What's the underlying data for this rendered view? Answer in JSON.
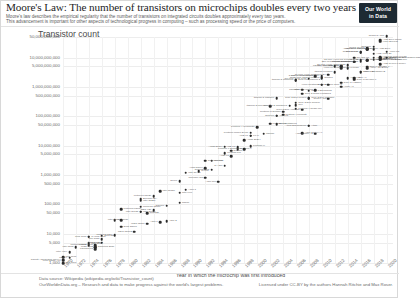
{
  "header": {
    "title": "Moore's Law: The number of transistors on microchips doubles every two years",
    "subtitle_line1": "Moore's law describes the empirical regularity that the number of transistors on integrated circuits doubles approximately every two years.",
    "subtitle_line2": "This advancement is important for other aspects of technological progress in computing – such as processing speed or the price of computers.",
    "logo_line1": "Our World",
    "logo_line2": "in Data"
  },
  "footer": {
    "source": "Data source: Wikipedia (wikipedia.org/wiki/Transistor_count)",
    "org": "OurWorldinData.org – Research and data to make progress against the world's largest problems.",
    "license": "Licensed under CC-BY by the authors Hannah Ritchie and Max Roser."
  },
  "chart_data": {
    "type": "scatter",
    "title": "Moore's Law: The number of transistors on microchips doubles every two years",
    "ylabel": "Transistor count",
    "xlabel": "Year in which the microchip was first introduced",
    "yscale": "log",
    "ylim": [
      1000,
      50000000000
    ],
    "xlim": [
      1970,
      2021
    ],
    "grid": true,
    "legend": "none",
    "ytick_labels": [
      "50,000,000,000",
      "10,000,000,000",
      "5,000,000,000",
      "1,000,000,000",
      "500,000,000",
      "100,000,000",
      "50,000,000",
      "10,000,000",
      "5,000,000",
      "1,000,000",
      "500,000",
      "100,000",
      "50,000",
      "10,000",
      "5,000",
      "1,000"
    ],
    "ytick_values": [
      50000000000,
      10000000000,
      5000000000,
      1000000000,
      500000000,
      100000000,
      50000000,
      10000000,
      5000000,
      1000000,
      500000,
      100000,
      50000,
      10000,
      5000,
      1000
    ],
    "xtick_labels": [
      "1970",
      "1972",
      "1974",
      "1976",
      "1978",
      "1980",
      "1982",
      "1984",
      "1986",
      "1988",
      "1990",
      "1992",
      "1994",
      "1996",
      "1998",
      "2000",
      "2002",
      "2004",
      "2006",
      "2008",
      "2010",
      "2012",
      "2014",
      "2016",
      "2018",
      "2020"
    ],
    "points": [
      {
        "name": "Intel 4004",
        "year": 1971,
        "value": 2300,
        "side": "left"
      },
      {
        "name": "Intel 8008",
        "year": 1972,
        "value": 3500,
        "side": "left"
      },
      {
        "name": "Motorola 6800",
        "year": 1974,
        "value": 4100,
        "side": "left"
      },
      {
        "name": "Intel 8080",
        "year": 1974,
        "value": 4500,
        "side": "right"
      },
      {
        "name": "RCA 1802",
        "year": 1974,
        "value": 5000,
        "side": "right"
      },
      {
        "name": "MOS 6502",
        "year": 1975,
        "value": 3510,
        "side": "left"
      },
      {
        "name": "Zilog Z80",
        "year": 1976,
        "value": 8500,
        "side": "right"
      },
      {
        "name": "Intel 8085",
        "year": 1976,
        "value": 6500,
        "side": "left"
      },
      {
        "name": "TMS 1000",
        "year": 1974,
        "value": 8000,
        "side": "left"
      },
      {
        "name": "Motorola 6809",
        "year": 1978,
        "value": 9000,
        "side": "left"
      },
      {
        "name": "Intel 8086",
        "year": 1978,
        "value": 29000,
        "side": "right"
      },
      {
        "name": "Intel 8088",
        "year": 1979,
        "value": 29000,
        "side": "left"
      },
      {
        "name": "Zilog Z8000",
        "year": 1979,
        "value": 17500,
        "side": "right"
      },
      {
        "name": "WDC 65C02",
        "year": 1981,
        "value": 11500,
        "side": "left"
      },
      {
        "name": "Intel 80186",
        "year": 1982,
        "value": 55000,
        "side": "right"
      },
      {
        "name": "Motorola 68000",
        "year": 1979,
        "value": 68000,
        "side": "right"
      },
      {
        "name": "Intel 80286",
        "year": 1982,
        "value": 134000,
        "side": "right"
      },
      {
        "name": "Intel 80386",
        "year": 1985,
        "value": 275000,
        "side": "right"
      },
      {
        "name": "ARM 1",
        "year": 1985,
        "value": 25000,
        "side": "left"
      },
      {
        "name": "ARM 2",
        "year": 1986,
        "value": 27000,
        "side": "right"
      },
      {
        "name": "Motorola 68020",
        "year": 1984,
        "value": 190000,
        "side": "left"
      },
      {
        "name": "Intel i960",
        "year": 1988,
        "value": 250000,
        "side": "right"
      },
      {
        "name": "ARM 3",
        "year": 1989,
        "value": 310000,
        "side": "right"
      },
      {
        "name": "Intel 80486",
        "year": 1989,
        "value": 1180000,
        "side": "right"
      },
      {
        "name": "R4000",
        "year": 1991,
        "value": 1350000,
        "side": "right"
      },
      {
        "name": "Pentium",
        "year": 1993,
        "value": 3100000,
        "side": "right"
      },
      {
        "name": "ARM 700",
        "year": 1994,
        "value": 578977,
        "side": "left"
      },
      {
        "name": "Pentium Pro",
        "year": 1995,
        "value": 5500000,
        "side": "right"
      },
      {
        "name": "AMD K5",
        "year": 1996,
        "value": 4300000,
        "side": "left"
      },
      {
        "name": "Pentium II",
        "year": 1997,
        "value": 7500000,
        "side": "right"
      },
      {
        "name": "AMD K6",
        "year": 1997,
        "value": 8800000,
        "side": "left"
      },
      {
        "name": "Pentium III",
        "year": 1999,
        "value": 9500000,
        "side": "right"
      },
      {
        "name": "AMD K7",
        "year": 1999,
        "value": 22000000,
        "side": "left"
      },
      {
        "name": "Pentium 4 Willamette",
        "year": 2000,
        "value": 42000000,
        "side": "left"
      },
      {
        "name": "Pentium 4 Northwood",
        "year": 2002,
        "value": 55000000,
        "side": "right"
      },
      {
        "name": "Barton",
        "year": 2003,
        "value": 54300000,
        "side": "right"
      },
      {
        "name": "Pentium 4 Prescott",
        "year": 2004,
        "value": 112000000,
        "side": "right"
      },
      {
        "name": "Itanium",
        "year": 2001,
        "value": 25000000,
        "side": "right"
      },
      {
        "name": "Itanium 2 McKinley",
        "year": 2002,
        "value": 220000000,
        "side": "left"
      },
      {
        "name": "Itanium 2 Madison",
        "year": 2003,
        "value": 410000000,
        "side": "left"
      },
      {
        "name": "Cell",
        "year": 2006,
        "value": 241000000,
        "side": "right"
      },
      {
        "name": "Core 2 Duo Conroe",
        "year": 2006,
        "value": 291000000,
        "side": "right"
      },
      {
        "name": "Core 2 Duo Wolfdale",
        "year": 2008,
        "value": 411000000,
        "side": "right"
      },
      {
        "name": "Atom",
        "year": 2008,
        "value": 47000000,
        "side": "right"
      },
      {
        "name": "Core i7 Bloomfield",
        "year": 2008,
        "value": 731000000,
        "side": "right"
      },
      {
        "name": "Itanium 2 Montecito",
        "year": 2006,
        "value": 1700000000,
        "side": "left"
      },
      {
        "name": "Six-core Xeon 7400",
        "year": 2008,
        "value": 1900000000,
        "side": "left"
      },
      {
        "name": "Quad-core Itanium Tukwila",
        "year": 2010,
        "value": 2000000000,
        "side": "left"
      },
      {
        "name": "8-core Xeon Nehalem-EX",
        "year": 2010,
        "value": 2300000000,
        "side": "left"
      },
      {
        "name": "10-core Xeon Westmere-EX",
        "year": 2011,
        "value": 2600000000,
        "side": "left"
      },
      {
        "name": "Six-core Core i7",
        "year": 2010,
        "value": 1170000000,
        "side": "right"
      },
      {
        "name": "Dual-core Itanium 2",
        "year": 2006,
        "value": 1700000000,
        "side": "right"
      },
      {
        "name": "Apple A7",
        "year": 2013,
        "value": 1000000000,
        "side": "right"
      },
      {
        "name": "Apple A8",
        "year": 2014,
        "value": 2000000000,
        "side": "right"
      },
      {
        "name": "Apple A9",
        "year": 2015,
        "value": 2000000000,
        "side": "right"
      },
      {
        "name": "Apple A10",
        "year": 2016,
        "value": 3300000000,
        "side": "right"
      },
      {
        "name": "Apple A11 Bionic",
        "year": 2017,
        "value": 4300000000,
        "side": "right"
      },
      {
        "name": "Apple A12X Bionic",
        "year": 2018,
        "value": 10000000000,
        "side": "right"
      },
      {
        "name": "Apple A13 Bionic",
        "year": 2019,
        "value": 8500000000,
        "side": "right"
      },
      {
        "name": "Qualcomm Snapdragon 8cx",
        "year": 2018,
        "value": 8500000000,
        "side": "right"
      },
      {
        "name": "HiSilicon Kirin 990 5G",
        "year": 2019,
        "value": 10300000000,
        "side": "right"
      },
      {
        "name": "AMD Ryzen 7 3700X",
        "year": 2019,
        "value": 5990000000,
        "side": "right"
      },
      {
        "name": "AMD Epyc Rome",
        "year": 2019,
        "value": 39540000000,
        "side": "right"
      },
      {
        "name": "AMD Epyc Naples",
        "year": 2017,
        "value": 19200000000,
        "side": "left"
      },
      {
        "name": "AMD Ryzen Threadripper",
        "year": 2018,
        "value": 19200000000,
        "side": "left"
      },
      {
        "name": "GC2 IPU",
        "year": 2018,
        "value": 23600000000,
        "side": "left"
      },
      {
        "name": "Xbox One main SoC",
        "year": 2013,
        "value": 5000000000,
        "side": "left"
      },
      {
        "name": "32-core AMD Epyc",
        "year": 2017,
        "value": 19200000000,
        "side": "right"
      },
      {
        "name": "72-core Xeon Phi Centriq 2400",
        "year": 2016,
        "value": 8000000000,
        "side": "left"
      },
      {
        "name": "IBM z13 Storage Controller",
        "year": 2015,
        "value": 7100000000,
        "side": "left"
      },
      {
        "name": "18-core Xeon Haswell-E5",
        "year": 2014,
        "value": 5560000000,
        "side": "left"
      },
      {
        "name": "Xbox One",
        "year": 2013,
        "value": 5000000000,
        "side": "left"
      },
      {
        "name": "62-core Xeon Phi",
        "year": 2012,
        "value": 5000000000,
        "side": "left"
      },
      {
        "name": "8-core Xeon Nehalem",
        "year": 2009,
        "value": 2300000000,
        "side": "left"
      },
      {
        "name": "Tegra 3",
        "year": 2011,
        "value": 1200000000,
        "side": "left"
      },
      {
        "name": "POWER6",
        "year": 2007,
        "value": 789000000,
        "side": "left"
      },
      {
        "name": "Core i7 Haswell",
        "year": 2013,
        "value": 1400000000,
        "side": "right"
      },
      {
        "name": "Core i7 Skylake K",
        "year": 2015,
        "value": 1750000000,
        "side": "right"
      },
      {
        "name": "SPARC M7",
        "year": 2015,
        "value": 10000000000,
        "side": "right"
      },
      {
        "name": "IBM z15",
        "year": 2019,
        "value": 9200000000,
        "side": "right"
      },
      {
        "name": "Tukwila",
        "year": 2010,
        "value": 2046000000,
        "side": "right"
      },
      {
        "name": "Pentium D Smithfield",
        "year": 2005,
        "value": 228000000,
        "side": "left"
      },
      {
        "name": "Core 2 Duo Allendale",
        "year": 2007,
        "value": 169000000,
        "side": "left"
      },
      {
        "name": "Pentium M Dothan",
        "year": 2004,
        "value": 140000000,
        "side": "left"
      },
      {
        "name": "Pentium 4 Cedar Mill",
        "year": 2006,
        "value": 184000000,
        "side": "right"
      },
      {
        "name": "ARM Cortex-A9",
        "year": 2007,
        "value": 26000000,
        "side": "right"
      },
      {
        "name": "SA-110",
        "year": 1995,
        "value": 2100000,
        "side": "left"
      },
      {
        "name": "Pentium Mobile Dixon",
        "year": 1999,
        "value": 27400000,
        "side": "left"
      },
      {
        "name": "K6-III",
        "year": 1999,
        "value": 21300000,
        "side": "right"
      },
      {
        "name": "Pentium II Deschutes",
        "year": 1998,
        "value": 7500000,
        "side": "left"
      },
      {
        "name": "AMD K8",
        "year": 2003,
        "value": 105900000,
        "side": "right"
      },
      {
        "name": "Opteron",
        "year": 2003,
        "value": 106000000,
        "side": "left"
      },
      {
        "name": "R10000",
        "year": 1996,
        "value": 6800000,
        "side": "right"
      },
      {
        "name": "Alpha 21264",
        "year": 1998,
        "value": 15200000,
        "side": "right"
      },
      {
        "name": "Alpha 21164",
        "year": 1995,
        "value": 9300000,
        "side": "left"
      },
      {
        "name": "Alpha 21064",
        "year": 1992,
        "value": 1680000,
        "side": "left"
      },
      {
        "name": "SuperSPARC",
        "year": 1992,
        "value": 3100000,
        "side": "right"
      },
      {
        "name": "hyperSPARC",
        "year": 1993,
        "value": 1500000,
        "side": "left"
      },
      {
        "name": "microSPARC",
        "year": 1992,
        "value": 800000,
        "side": "left"
      },
      {
        "name": "80960",
        "year": 1988,
        "value": 600000,
        "side": "left"
      },
      {
        "name": "R3000",
        "year": 1988,
        "value": 115000,
        "side": "right"
      },
      {
        "name": "Z80000",
        "year": 1986,
        "value": 91000,
        "side": "left"
      },
      {
        "name": "NEC V20",
        "year": 1984,
        "value": 63000,
        "side": "left"
      },
      {
        "name": "TMS320",
        "year": 1983,
        "value": 49000,
        "side": "right"
      },
      {
        "name": "Intel 80188",
        "year": 1982,
        "value": 55000,
        "side": "left"
      },
      {
        "name": "Motorola 68010",
        "year": 1982,
        "value": 84000,
        "side": "right"
      },
      {
        "name": "Bellmac-32A",
        "year": 1982,
        "value": 150000,
        "side": "right"
      },
      {
        "name": "WDC 65816",
        "year": 1983,
        "value": 22000,
        "side": "left"
      },
      {
        "name": "CDP 1802",
        "year": 1976,
        "value": 5000,
        "side": "left"
      },
      {
        "name": "Intersil 6100",
        "year": 1975,
        "value": 4000,
        "side": "left"
      },
      {
        "name": "Fairchild F8",
        "year": 1975,
        "value": 3000,
        "side": "left"
      },
      {
        "name": "Signetics 2650",
        "year": 1975,
        "value": 3500,
        "side": "right"
      },
      {
        "name": "TI TMS 1000",
        "year": 1974,
        "value": 8000,
        "side": "right"
      },
      {
        "name": "Intel 3101",
        "year": 1970,
        "value": 1000,
        "side": "right"
      },
      {
        "name": "Four-phase AL1",
        "year": 1970,
        "value": 1200,
        "side": "left"
      },
      {
        "name": "Garrett AiResearch MP944",
        "year": 1970,
        "value": 1300,
        "side": "left"
      },
      {
        "name": "Intel 1103",
        "year": 1970,
        "value": 1600,
        "side": "right"
      },
      {
        "name": "MP944",
        "year": 1971,
        "value": 1500,
        "side": "left"
      },
      {
        "name": "Nvidia GA100",
        "year": 2020,
        "value": 54200000000,
        "side": "left"
      },
      {
        "name": "Apple M1",
        "year": 2020,
        "value": 16000000000,
        "side": "right"
      },
      {
        "name": "AMD Ryzen 9 3950X",
        "year": 2019,
        "value": 9890000000,
        "side": "right"
      },
      {
        "name": "Nvidia GV100",
        "year": 2017,
        "value": 21100000000,
        "side": "left"
      },
      {
        "name": "AMD Vega 20",
        "year": 2018,
        "value": 13230000000,
        "side": "right"
      },
      {
        "name": "Nvidia GP100",
        "year": 2016,
        "value": 15300000000,
        "side": "left"
      },
      {
        "name": "Xilinx Everest",
        "year": 2019,
        "value": 35000000000,
        "side": "right"
      },
      {
        "name": "Tesla P100",
        "year": 2016,
        "value": 15000000000,
        "side": "left"
      },
      {
        "name": "IBM POWER9",
        "year": 2017,
        "value": 8000000000,
        "side": "right"
      },
      {
        "name": "Fujitsu A64FX",
        "year": 2019,
        "value": 8786000000,
        "side": "right"
      },
      {
        "name": "Qualcomm Snapdragon 888",
        "year": 2020,
        "value": 10000000000,
        "side": "right"
      },
      {
        "name": "Intel Xeon Broadwell-E5",
        "year": 2016,
        "value": 7200000000,
        "side": "left"
      },
      {
        "name": "Core i7 Broadwell-E",
        "year": 2016,
        "value": 3200000000,
        "side": "right"
      },
      {
        "name": "Core i9 Skylake X",
        "year": 2017,
        "value": 4800000000,
        "side": "right"
      },
      {
        "name": "Itanium Poulson",
        "year": 2012,
        "value": 3100000000,
        "side": "left"
      },
      {
        "name": "Xeon Ivy Bridge-EX",
        "year": 2014,
        "value": 4310000000,
        "side": "left"
      },
      {
        "name": "Xeon Broadwell",
        "year": 2015,
        "value": 7200000000,
        "side": "left"
      },
      {
        "name": "Xeon Skylake",
        "year": 2017,
        "value": 8000000000,
        "side": "left"
      },
      {
        "name": "Xeon Ivytown",
        "year": 2013,
        "value": 4310000000,
        "side": "right"
      },
      {
        "name": "Xeon Westmere",
        "year": 2010,
        "value": 1170000000,
        "side": "left"
      },
      {
        "name": "Core i5 Lynnfield",
        "year": 2009,
        "value": 774000000,
        "side": "left"
      },
      {
        "name": "Core 2 Quad Kentsfield",
        "year": 2007,
        "value": 582000000,
        "side": "right"
      },
      {
        "name": "Core 2 Duo Penryn",
        "year": 2008,
        "value": 410000000,
        "side": "left"
      },
      {
        "name": "Cortex A15",
        "year": 2011,
        "value": 400000000,
        "side": "left"
      },
      {
        "name": "Atom Diamondville",
        "year": 2008,
        "value": 47000000,
        "side": "left"
      },
      {
        "name": "ARM Cortex-A5",
        "year": 2009,
        "value": 25000000,
        "side": "left"
      }
    ]
  }
}
